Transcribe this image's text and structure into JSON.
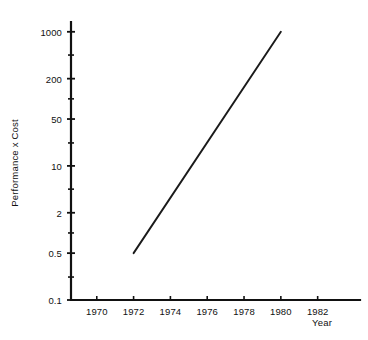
{
  "chart_data": {
    "type": "line",
    "title": "",
    "xlabel": "Year",
    "ylabel": "Performance x Cost",
    "grid": false,
    "legend": null,
    "yscale": "log",
    "xlim": [
      1968.6,
      1984.3
    ],
    "ylim": [
      0.1,
      1400
    ],
    "y_ticks": [
      "1000",
      "200",
      "50",
      "10",
      "2",
      "0.5",
      "0.1"
    ],
    "y_tick_values": [
      1000,
      200,
      50,
      10,
      2,
      0.5,
      0.1
    ],
    "y_minor_tick_values": [
      450,
      100,
      22,
      4.5,
      1,
      0.22
    ],
    "x_ticks": [
      "1970",
      "1972",
      "1974",
      "1976",
      "1978",
      "1980",
      "1982"
    ],
    "x_tick_values": [
      1970,
      1972,
      1974,
      1976,
      1978,
      1980,
      1982
    ],
    "series": [
      {
        "name": "Performance x Cost",
        "x": [
          1972,
          1980
        ],
        "values": [
          0.5,
          1000
        ]
      }
    ],
    "colors": {
      "line": "#1a1a1a",
      "axis": "#111111",
      "background": "#ffffff"
    }
  },
  "axis_titles": {
    "y": "Performance x Cost",
    "x": "Year"
  }
}
